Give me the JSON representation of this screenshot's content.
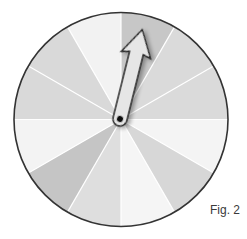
{
  "figure": {
    "label": "Fig. 2",
    "type": "spinner"
  },
  "spinner": {
    "center": [
      121,
      119.5
    ],
    "radius": 107,
    "outline_color": "#333333",
    "divider_color": "#ffffff",
    "sector_count": 12,
    "sectors": [
      {
        "index": 1,
        "start_deg": 0,
        "end_deg": 30,
        "color": "#c7c7c7"
      },
      {
        "index": 2,
        "start_deg": 30,
        "end_deg": 60,
        "color": "#dadada"
      },
      {
        "index": 3,
        "start_deg": 60,
        "end_deg": 90,
        "color": "#dadada"
      },
      {
        "index": 4,
        "start_deg": 90,
        "end_deg": 120,
        "color": "#f4f4f4"
      },
      {
        "index": 5,
        "start_deg": 120,
        "end_deg": 150,
        "color": "#d7d7d7"
      },
      {
        "index": 6,
        "start_deg": 150,
        "end_deg": 180,
        "color": "#f5f5f5"
      },
      {
        "index": 7,
        "start_deg": 180,
        "end_deg": 210,
        "color": "#dedede"
      },
      {
        "index": 8,
        "start_deg": 210,
        "end_deg": 240,
        "color": "#c5c5c5"
      },
      {
        "index": 9,
        "start_deg": 240,
        "end_deg": 270,
        "color": "#f3f3f3"
      },
      {
        "index": 10,
        "start_deg": 270,
        "end_deg": 300,
        "color": "#d9d9d9"
      },
      {
        "index": 11,
        "start_deg": 300,
        "end_deg": 330,
        "color": "#d9d9d9"
      },
      {
        "index": 12,
        "start_deg": 330,
        "end_deg": 360,
        "color": "#f2f2f2"
      }
    ],
    "needle": {
      "pivot": [
        120,
        119
      ],
      "angle_deg": 14,
      "length": 92,
      "fill": "#e6e6e6",
      "stroke": "#222222",
      "pivot_dot_color": "#111111",
      "points_to_sector": 1
    }
  }
}
